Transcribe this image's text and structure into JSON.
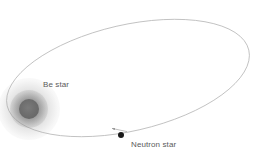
{
  "figure": {
    "type": "astronomy-orbit-diagram",
    "background_color": "#ffffff",
    "width": 256,
    "height": 155
  },
  "orbit": {
    "name": "elliptical-orbit",
    "stroke_color": "#b9b9b9",
    "stroke_width": 0.8,
    "center_x": 128,
    "center_y": 78,
    "semi_major": 124,
    "semi_minor": 53,
    "rotation_deg": -13
  },
  "bodies": {
    "be_star": {
      "label": "Be star",
      "core_color": "#6e6e6e",
      "halo_color": "#8a8a8a",
      "center_x": 29,
      "center_y": 109,
      "core_radius": 10,
      "halo_radius": 31
    },
    "neutron_star": {
      "label": "Neutron star",
      "color": "#1a1a1a",
      "center_x": 121,
      "center_y": 135,
      "radius": 3
    }
  },
  "annotations": {
    "velocity_arrow": {
      "name": "velocity-arrow",
      "color": "#9a9a9a",
      "x1": 126,
      "y1": 131,
      "x2": 112,
      "y2": 128
    }
  },
  "labels": {
    "be_star": "Be star",
    "neutron_star": "Neutron star",
    "text_color": "#5a5a5a"
  }
}
